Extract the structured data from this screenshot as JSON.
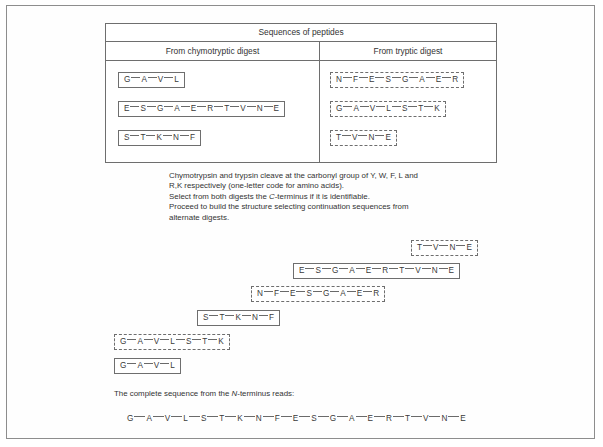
{
  "figure": {
    "table": {
      "title": "Sequences of peptides",
      "columns": [
        {
          "header": "From chymotryptic digest",
          "style": "solid"
        },
        {
          "header": "From tryptic digest",
          "style": "dashed"
        }
      ],
      "chymotryptic_peptides": [
        {
          "residues": [
            "G",
            "A",
            "V",
            "L"
          ]
        },
        {
          "residues": [
            "E",
            "S",
            "G",
            "A",
            "E",
            "R",
            "T",
            "V",
            "N",
            "E"
          ]
        },
        {
          "residues": [
            "S",
            "T",
            "K",
            "N",
            "F"
          ]
        }
      ],
      "tryptic_peptides": [
        {
          "residues": [
            "N",
            "F",
            "E",
            "S",
            "G",
            "A",
            "E",
            "R"
          ]
        },
        {
          "residues": [
            "G",
            "A",
            "V",
            "L",
            "S",
            "T",
            "K"
          ]
        },
        {
          "residues": [
            "T",
            "V",
            "N",
            "E"
          ]
        }
      ]
    },
    "instructions": [
      "Chymotrypsin and trypsin cleave at the carbonyl group of Y, W, F, L and",
      "R,K respectively (one-letter code for amino acids).",
      "Select from both digests the C-terminus if it is identifiable.",
      "Proceed to build the structure selecting continuation sequences from",
      "alternate digests."
    ],
    "instruction_italic_terms": [
      "C"
    ],
    "staircase": [
      {
        "residues": [
          "T",
          "V",
          "N",
          "E"
        ],
        "style": "dashed",
        "digest": "tryptic",
        "left": 404,
        "top": 230
      },
      {
        "residues": [
          "E",
          "S",
          "G",
          "A",
          "E",
          "R",
          "T",
          "V",
          "N",
          "E"
        ],
        "style": "solid",
        "digest": "chymotryptic",
        "left": 286,
        "top": 253
      },
      {
        "residues": [
          "N",
          "F",
          "E",
          "S",
          "G",
          "A",
          "E",
          "R"
        ],
        "style": "dashed",
        "digest": "tryptic",
        "left": 244,
        "top": 276
      },
      {
        "residues": [
          "S",
          "T",
          "K",
          "N",
          "F"
        ],
        "style": "solid",
        "digest": "chymotryptic",
        "left": 190,
        "top": 300
      },
      {
        "residues": [
          "G",
          "A",
          "V",
          "L",
          "S",
          "T",
          "K"
        ],
        "style": "dashed",
        "digest": "tryptic",
        "left": 107,
        "top": 324
      },
      {
        "residues": [
          "G",
          "A",
          "V",
          "L"
        ],
        "style": "solid",
        "digest": "chymotryptic",
        "left": 107,
        "top": 348
      }
    ],
    "final": {
      "label_before": "The complete sequence from the ",
      "label_italic": "N",
      "label_after": "-terminus reads:",
      "sequence": [
        "G",
        "A",
        "V",
        "L",
        "S",
        "T",
        "K",
        "N",
        "F",
        "E",
        "S",
        "G",
        "A",
        "E",
        "R",
        "T",
        "V",
        "N",
        "E"
      ]
    }
  },
  "colors": {
    "frame_border": "#8d8d8d",
    "table_border": "#6e6e6e",
    "text": "#333333",
    "residue_text": "#3a3a3a",
    "bond_line": "#6a6a6a",
    "background": "#ffffff"
  }
}
